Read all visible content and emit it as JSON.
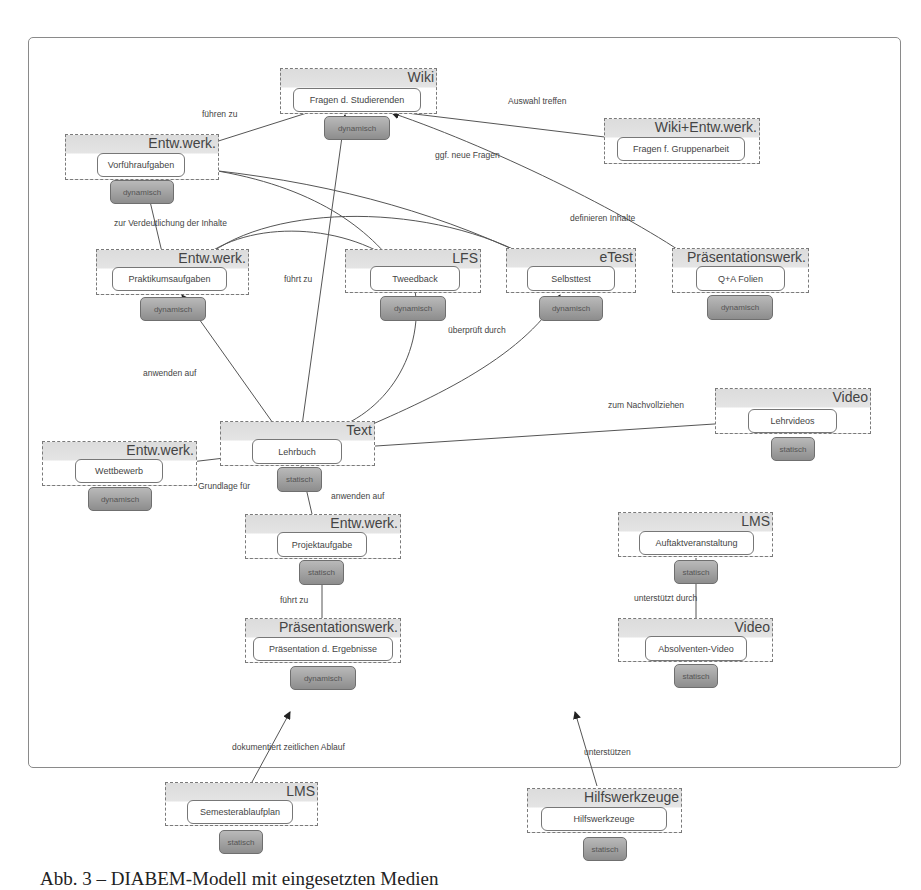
{
  "caption": "Abb. 3 – DIABEM-Modell mit eingesetzten Medien",
  "groups": [
    {
      "id": "wiki",
      "label": "Wiki",
      "node": "Fragen d. Studierenden",
      "badge": "dynamisch"
    },
    {
      "id": "wikient",
      "label": "Wiki+Entw.werk.",
      "node": "Fragen f. Gruppenarbeit",
      "badge": ""
    },
    {
      "id": "vorf",
      "label": "Entw.werk.",
      "node": "Vorführaufgaben",
      "badge": "dynamisch"
    },
    {
      "id": "prakt",
      "label": "Entw.werk.",
      "node": "Praktikumsaufgaben",
      "badge": "dynamisch"
    },
    {
      "id": "lfs",
      "label": "LFS",
      "node": "Tweedback",
      "badge": "dynamisch"
    },
    {
      "id": "etest",
      "label": "eTest",
      "node": "Selbsttest",
      "badge": "dynamisch"
    },
    {
      "id": "praes1",
      "label": "Präsentationswerk.",
      "node": "Q+A Folien",
      "badge": "dynamisch"
    },
    {
      "id": "video1",
      "label": "Video",
      "node": "Lehrvideos",
      "badge": "statisch"
    },
    {
      "id": "text",
      "label": "Text",
      "node": "Lehrbuch",
      "badge": "statisch"
    },
    {
      "id": "wett",
      "label": "Entw.werk.",
      "node": "Wettbewerb",
      "badge": "dynamisch"
    },
    {
      "id": "projekt",
      "label": "Entw.werk.",
      "node": "Projektaufgabe",
      "badge": "statisch"
    },
    {
      "id": "lms1",
      "label": "LMS",
      "node": "Auftaktveranstaltung",
      "badge": "statisch"
    },
    {
      "id": "praes2",
      "label": "Präsentationswerk.",
      "node": "Präsentation d. Ergebnisse",
      "badge": "dynamisch"
    },
    {
      "id": "video2",
      "label": "Video",
      "node": "Absolventen-Video",
      "badge": "statisch"
    },
    {
      "id": "lms2",
      "label": "LMS",
      "node": "Semesterablaufplan",
      "badge": "statisch"
    },
    {
      "id": "hilf",
      "label": "Hilfswerkzeuge",
      "node": "Hilfswerkzeuge",
      "badge": "statisch"
    }
  ],
  "edge_labels": [
    {
      "id": "fuehren-zu",
      "text": "führen zu"
    },
    {
      "id": "auswahl-treffen",
      "text": "Auswahl treffen"
    },
    {
      "id": "ggf-neue-fragen",
      "text": "ggf. neue Fragen"
    },
    {
      "id": "definieren-inhalte",
      "text": "definieren Inhalte"
    },
    {
      "id": "zur-verdeutlichung",
      "text": "zur Verdeutlichung der Inhalte"
    },
    {
      "id": "fuehrt-zu-1",
      "text": "führt zu"
    },
    {
      "id": "ueberprueft-durch",
      "text": "überprüft durch"
    },
    {
      "id": "anwenden-auf-1",
      "text": "anwenden auf"
    },
    {
      "id": "zum-nachvollziehen",
      "text": "zum Nachvollziehen"
    },
    {
      "id": "grundlage-fuer",
      "text": "Grundlage für"
    },
    {
      "id": "anwenden-auf-2",
      "text": "anwenden auf"
    },
    {
      "id": "fuehrt-zu-2",
      "text": "führt zu"
    },
    {
      "id": "unterstuetzt-durch",
      "text": "unterstützt durch"
    },
    {
      "id": "dokumentiert",
      "text": "dokumentiert zeitlichen Ablauf"
    },
    {
      "id": "unterstuetzen",
      "text": "unterstützen"
    }
  ]
}
